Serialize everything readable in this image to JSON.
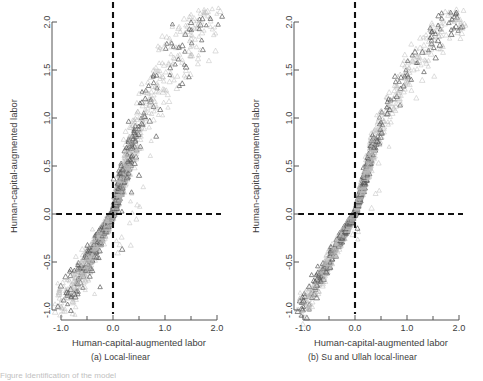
{
  "figure": {
    "background_color": "#ffffff",
    "marker_color_light": "#b9b9b9",
    "marker_color_dark": "#5a5a5a",
    "axis_color": "#555555",
    "reference_line_color": "#111111",
    "caption_partial": "Figure  Identification of the model"
  },
  "panels": [
    {
      "id": "panel-a",
      "subcaption": "(a) Local-linear",
      "chart_data": {
        "type": "scatter",
        "title": "",
        "xlabel": "Human-capital-augmented labor",
        "ylabel": "Human-capital-augmented labor",
        "xlim": [
          -1.15,
          2.15
        ],
        "ylim": [
          -1.15,
          2.15
        ],
        "xticks": [
          -1.0,
          0.0,
          1.0,
          2.0
        ],
        "xticklabels": [
          "-1.0",
          "0.0",
          "1.0",
          "2.0"
        ],
        "xminorticks": [
          -0.5,
          0.5,
          1.5
        ],
        "yticks": [
          -1.0,
          -0.5,
          0.0,
          0.5,
          1.0,
          1.5,
          2.0
        ],
        "yticklabels": [
          "-1.0",
          "-0.5",
          "0.0",
          "0.5",
          "1.0",
          "1.5",
          "2.0"
        ],
        "grid": false,
        "legend": "none",
        "marker": "triangle-open",
        "reference_lines": [
          {
            "orientation": "horizontal",
            "value": 0.0,
            "style": "dashed"
          },
          {
            "orientation": "vertical",
            "value": 0.0,
            "style": "dashed"
          }
        ],
        "annotations": [
          "Points follow the 45-degree diagonal with dispersion increasing away from the origin"
        ],
        "series": [
          {
            "name": "observations",
            "x": [
              -0.95,
              -0.93,
              -0.92,
              -0.9,
              -0.88,
              -0.86,
              -0.85,
              -0.83,
              -0.8,
              -0.78,
              -0.75,
              -0.72,
              -0.7,
              -0.68,
              -0.65,
              -0.63,
              -0.6,
              -0.58,
              -0.55,
              -0.53,
              -0.5,
              -0.48,
              -0.45,
              -0.43,
              -0.4,
              -0.38,
              -0.36,
              -0.34,
              -0.32,
              -0.3,
              -0.28,
              -0.26,
              -0.24,
              -0.22,
              -0.2,
              -0.19,
              -0.18,
              -0.17,
              -0.16,
              -0.15,
              -0.14,
              -0.13,
              -0.12,
              -0.11,
              -0.1,
              -0.09,
              -0.08,
              -0.07,
              -0.06,
              -0.05,
              -0.04,
              -0.03,
              -0.02,
              -0.01,
              0.0,
              0.01,
              0.02,
              0.03,
              0.04,
              0.05,
              0.06,
              0.07,
              0.08,
              0.09,
              0.1,
              0.11,
              0.12,
              0.13,
              0.14,
              0.15,
              0.16,
              0.17,
              0.18,
              0.19,
              0.2,
              0.21,
              0.22,
              0.23,
              0.24,
              0.25,
              0.26,
              0.28,
              0.3,
              0.32,
              0.34,
              0.36,
              0.38,
              0.4,
              0.42,
              0.44,
              0.46,
              0.48,
              0.5,
              0.52,
              0.55,
              0.58,
              0.6,
              0.63,
              0.66,
              0.7,
              0.74,
              0.78,
              0.82,
              0.86,
              0.9,
              0.95,
              1.0,
              1.05,
              1.1,
              1.15,
              1.2,
              1.25,
              1.3,
              1.35,
              1.4,
              1.45,
              1.5,
              1.55,
              1.6,
              1.65,
              1.7,
              1.75,
              1.8,
              1.85,
              1.9,
              1.95,
              2.0,
              2.05
            ],
            "y": [
              -0.92,
              -0.9,
              -0.95,
              -0.86,
              -0.9,
              -0.82,
              -0.88,
              -0.8,
              -0.76,
              -0.8,
              -0.72,
              -0.7,
              -0.66,
              -0.72,
              -0.62,
              -0.66,
              -0.58,
              -0.6,
              -0.52,
              -0.56,
              -0.48,
              -0.5,
              -0.44,
              -0.46,
              -0.38,
              -0.4,
              -0.34,
              -0.36,
              -0.3,
              -0.32,
              -0.26,
              -0.28,
              -0.22,
              -0.24,
              -0.18,
              -0.2,
              -0.17,
              -0.16,
              -0.15,
              -0.14,
              -0.13,
              -0.12,
              -0.11,
              -0.1,
              -0.09,
              -0.08,
              -0.07,
              -0.06,
              -0.05,
              -0.04,
              -0.03,
              -0.02,
              -0.01,
              0.0,
              0.0,
              0.02,
              0.04,
              0.06,
              0.08,
              0.1,
              0.12,
              0.14,
              0.16,
              0.18,
              0.2,
              0.22,
              0.24,
              0.26,
              0.28,
              0.3,
              0.32,
              0.34,
              0.36,
              0.38,
              0.4,
              0.42,
              0.44,
              0.46,
              0.48,
              0.5,
              0.52,
              0.56,
              0.6,
              0.64,
              0.68,
              0.7,
              0.74,
              0.78,
              0.8,
              0.84,
              0.86,
              0.9,
              0.92,
              0.96,
              1.0,
              1.02,
              1.06,
              1.1,
              1.14,
              1.18,
              1.22,
              1.26,
              1.3,
              1.34,
              1.36,
              1.42,
              1.46,
              1.5,
              1.54,
              1.58,
              1.62,
              1.66,
              1.7,
              1.74,
              1.76,
              1.8,
              1.84,
              1.86,
              1.9,
              1.92,
              1.96,
              1.98,
              2.0,
              2.02,
              2.04,
              2.06,
              2.08,
              2.1
            ]
          }
        ]
      }
    },
    {
      "id": "panel-b",
      "subcaption": "(b) Su and Ullah local-linear",
      "chart_data": {
        "type": "scatter",
        "title": "",
        "xlabel": "Human-capital-augmented labor",
        "ylabel": "Human-capital-augmented labor",
        "xlim": [
          -1.15,
          2.15
        ],
        "ylim": [
          -1.15,
          2.15
        ],
        "xticks": [
          -1.0,
          0.0,
          1.0,
          2.0
        ],
        "xticklabels": [
          "-1.0",
          "0.0",
          "1.0",
          "2.0"
        ],
        "xminorticks": [
          -0.5,
          0.5,
          1.5
        ],
        "yticks": [
          -1.0,
          -0.5,
          0.0,
          0.5,
          1.0,
          1.5,
          2.0
        ],
        "yticklabels": [
          "-1.0",
          "-0.5",
          "0.0",
          "0.5",
          "1.0",
          "1.5",
          "2.0"
        ],
        "grid": false,
        "legend": "none",
        "marker": "triangle-open",
        "reference_lines": [
          {
            "orientation": "horizontal",
            "value": 0.0,
            "style": "dashed"
          },
          {
            "orientation": "vertical",
            "value": 0.0,
            "style": "dashed"
          }
        ],
        "annotations": [
          "Tighter concentration along the 45-degree diagonal than panel (a)"
        ],
        "series": [
          {
            "name": "observations",
            "x": [
              -1.02,
              -1.0,
              -0.98,
              -0.96,
              -0.94,
              -0.9,
              -0.88,
              -0.85,
              -0.82,
              -0.8,
              -0.78,
              -0.75,
              -0.72,
              -0.7,
              -0.68,
              -0.65,
              -0.62,
              -0.6,
              -0.57,
              -0.54,
              -0.51,
              -0.48,
              -0.45,
              -0.42,
              -0.4,
              -0.37,
              -0.34,
              -0.32,
              -0.3,
              -0.28,
              -0.26,
              -0.24,
              -0.22,
              -0.2,
              -0.18,
              -0.17,
              -0.16,
              -0.15,
              -0.14,
              -0.13,
              -0.12,
              -0.11,
              -0.1,
              -0.09,
              -0.08,
              -0.07,
              -0.06,
              -0.05,
              -0.04,
              -0.03,
              -0.02,
              -0.01,
              0.0,
              0.01,
              0.02,
              0.03,
              0.04,
              0.05,
              0.06,
              0.07,
              0.08,
              0.09,
              0.1,
              0.11,
              0.12,
              0.13,
              0.14,
              0.15,
              0.16,
              0.17,
              0.18,
              0.19,
              0.2,
              0.21,
              0.22,
              0.23,
              0.24,
              0.25,
              0.26,
              0.27,
              0.28,
              0.3,
              0.32,
              0.34,
              0.36,
              0.38,
              0.4,
              0.43,
              0.46,
              0.49,
              0.52,
              0.55,
              0.58,
              0.62,
              0.66,
              0.7,
              0.74,
              0.78,
              0.82,
              0.86,
              0.9,
              0.95,
              1.0,
              1.05,
              1.1,
              1.15,
              1.2,
              1.25,
              1.3,
              1.35,
              1.4,
              1.45,
              1.5,
              1.55,
              1.6,
              1.65,
              1.7,
              1.75,
              1.8,
              1.85,
              1.9,
              1.95,
              2.0,
              2.05,
              2.08
            ],
            "y": [
              -1.0,
              -0.98,
              -1.02,
              -0.94,
              -0.98,
              -0.86,
              -0.9,
              -0.82,
              -0.84,
              -0.78,
              -0.8,
              -0.72,
              -0.74,
              -0.68,
              -0.7,
              -0.62,
              -0.64,
              -0.58,
              -0.55,
              -0.52,
              -0.49,
              -0.46,
              -0.43,
              -0.4,
              -0.38,
              -0.35,
              -0.32,
              -0.3,
              -0.28,
              -0.26,
              -0.24,
              -0.22,
              -0.2,
              -0.18,
              -0.16,
              -0.15,
              -0.14,
              -0.13,
              -0.12,
              -0.11,
              -0.1,
              -0.09,
              -0.08,
              -0.07,
              -0.06,
              -0.05,
              -0.04,
              -0.03,
              -0.02,
              -0.01,
              0.0,
              0.0,
              0.0,
              0.02,
              0.04,
              0.06,
              0.08,
              0.1,
              0.12,
              0.14,
              0.16,
              0.18,
              0.2,
              0.22,
              0.24,
              0.26,
              0.28,
              0.3,
              0.32,
              0.34,
              0.36,
              0.38,
              0.4,
              0.42,
              0.44,
              0.46,
              0.48,
              0.5,
              0.52,
              0.54,
              0.56,
              0.6,
              0.64,
              0.68,
              0.72,
              0.76,
              0.8,
              0.84,
              0.88,
              0.92,
              0.96,
              1.0,
              1.04,
              1.08,
              1.12,
              1.16,
              1.2,
              1.24,
              1.28,
              1.32,
              1.36,
              1.4,
              1.44,
              1.48,
              1.52,
              1.56,
              1.6,
              1.64,
              1.68,
              1.72,
              1.76,
              1.8,
              1.82,
              1.86,
              1.88,
              1.92,
              1.94,
              1.96,
              1.98,
              2.0,
              2.02,
              2.04,
              2.06,
              2.08,
              2.1
            ]
          }
        ]
      }
    }
  ]
}
